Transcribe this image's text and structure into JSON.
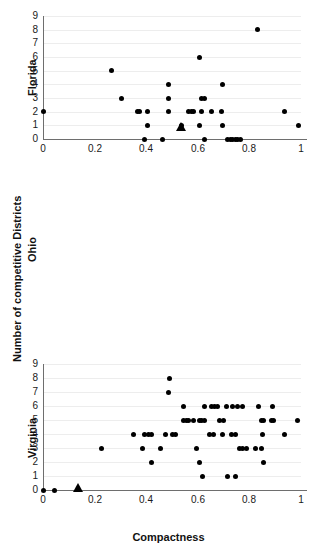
{
  "figure": {
    "xlabel": "Compactness",
    "outer_ylabel": "Number of competitive Districts",
    "background": "#ffffff",
    "point_color": "#000000",
    "grid_color": "#ededed",
    "axis_color": "#6e6e6e"
  },
  "chart_data": [
    {
      "type": "scatter",
      "title": "",
      "panel": "Florida",
      "ylabel": "Florida",
      "xlabel": "",
      "xlim": [
        0,
        1
      ],
      "ylim": [
        0,
        9
      ],
      "xticks": [
        0,
        0.2,
        0.4,
        0.6,
        0.8,
        1
      ],
      "xtick_labels": [
        "0",
        "0.2",
        "0.4",
        "0.6",
        "0.8",
        "1"
      ],
      "yticks": [
        0,
        1,
        2,
        3,
        4,
        5,
        6,
        7,
        8,
        9
      ],
      "ytick_labels": [
        "0",
        "1",
        "2",
        "3",
        "4",
        "5",
        "6",
        "7",
        "8",
        "9"
      ],
      "grid": true,
      "series": [
        {
          "name": "districts",
          "marker": "circle",
          "points": [
            [
              0.0,
              2
            ],
            [
              0.265,
              5
            ],
            [
              0.305,
              3
            ],
            [
              0.365,
              2
            ],
            [
              0.375,
              2
            ],
            [
              0.405,
              2
            ],
            [
              0.405,
              1
            ],
            [
              0.395,
              0
            ],
            [
              0.465,
              0
            ],
            [
              0.485,
              4
            ],
            [
              0.485,
              3
            ],
            [
              0.485,
              2
            ],
            [
              0.535,
              1
            ],
            [
              0.565,
              2
            ],
            [
              0.575,
              2
            ],
            [
              0.585,
              2
            ],
            [
              0.605,
              6
            ],
            [
              0.615,
              3
            ],
            [
              0.625,
              3
            ],
            [
              0.615,
              2
            ],
            [
              0.605,
              1
            ],
            [
              0.625,
              0
            ],
            [
              0.655,
              2
            ],
            [
              0.69,
              2
            ],
            [
              0.695,
              4
            ],
            [
              0.695,
              1
            ],
            [
              0.715,
              0
            ],
            [
              0.725,
              0
            ],
            [
              0.735,
              0
            ],
            [
              0.745,
              0
            ],
            [
              0.755,
              0
            ],
            [
              0.765,
              0
            ],
            [
              0.83,
              8
            ],
            [
              0.935,
              2
            ],
            [
              0.99,
              1
            ]
          ]
        },
        {
          "name": "mean-marker",
          "marker": "triangle",
          "points": [
            [
              0.535,
              0.85
            ]
          ]
        }
      ]
    },
    {
      "type": "scatter",
      "title": "",
      "panel": "Ohio",
      "ylabel": "Ohio",
      "xlabel": "",
      "xlim": [
        0,
        1
      ],
      "ylim": [
        0,
        9
      ],
      "xticks": [
        0,
        0.2,
        0.4,
        0.6,
        0.8,
        1
      ],
      "xtick_labels": [
        "0",
        "0.2",
        "0.4",
        "0.6",
        "0.8",
        "1"
      ],
      "yticks": [
        0,
        1,
        2,
        3,
        4,
        5,
        6,
        7,
        8,
        9
      ],
      "ytick_labels": [
        "0",
        "1",
        "2",
        "3",
        "4",
        "5",
        "6",
        "7",
        "8",
        "9"
      ],
      "grid": true,
      "series": [
        {
          "name": "districts",
          "marker": "circle",
          "points": [
            [
              0.0,
              0
            ],
            [
              0.045,
              0
            ],
            [
              0.225,
              3
            ],
            [
              0.35,
              4
            ],
            [
              0.395,
              4
            ],
            [
              0.41,
              4
            ],
            [
              0.42,
              4
            ],
            [
              0.385,
              3
            ],
            [
              0.42,
              2
            ],
            [
              0.455,
              3
            ],
            [
              0.49,
              8
            ],
            [
              0.485,
              7
            ],
            [
              0.475,
              4
            ],
            [
              0.5,
              4
            ],
            [
              0.515,
              4
            ],
            [
              0.545,
              5
            ],
            [
              0.555,
              5
            ],
            [
              0.565,
              5
            ],
            [
              0.545,
              6
            ],
            [
              0.585,
              5
            ],
            [
              0.605,
              5
            ],
            [
              0.615,
              5
            ],
            [
              0.625,
              5
            ],
            [
              0.595,
              3
            ],
            [
              0.605,
              2
            ],
            [
              0.62,
              1
            ],
            [
              0.625,
              6
            ],
            [
              0.655,
              6
            ],
            [
              0.665,
              6
            ],
            [
              0.675,
              6
            ],
            [
              0.645,
              4
            ],
            [
              0.66,
              4
            ],
            [
              0.685,
              5
            ],
            [
              0.7,
              5
            ],
            [
              0.695,
              4
            ],
            [
              0.71,
              6
            ],
            [
              0.735,
              6
            ],
            [
              0.73,
              4
            ],
            [
              0.745,
              4
            ],
            [
              0.715,
              1
            ],
            [
              0.745,
              1
            ],
            [
              0.755,
              6
            ],
            [
              0.775,
              6
            ],
            [
              0.76,
              3
            ],
            [
              0.775,
              3
            ],
            [
              0.79,
              3
            ],
            [
              0.835,
              6
            ],
            [
              0.845,
              5
            ],
            [
              0.855,
              5
            ],
            [
              0.85,
              4
            ],
            [
              0.855,
              2
            ],
            [
              0.825,
              3
            ],
            [
              0.845,
              3
            ],
            [
              0.885,
              5
            ],
            [
              0.895,
              5
            ],
            [
              0.89,
              6
            ],
            [
              0.935,
              4
            ],
            [
              0.985,
              5
            ]
          ]
        },
        {
          "name": "mean-marker",
          "marker": "triangle",
          "points": [
            [
              0.135,
              0.12
            ]
          ]
        }
      ]
    },
    {
      "type": "scatter",
      "title": "",
      "panel": "Virginia",
      "ylabel": "Virginia",
      "xlabel": "Compactness",
      "xlim": [
        0,
        1
      ],
      "ylim": [
        0,
        4
      ],
      "xticks": [
        0,
        0.2,
        0.4,
        0.6,
        0.8,
        1
      ],
      "xtick_labels": [
        "0",
        "0.2",
        "0.4",
        "0.6",
        "0.8",
        "1"
      ],
      "yticks": [
        0,
        1,
        2,
        3,
        4
      ],
      "ytick_labels": [
        "0",
        "1",
        "2",
        "3",
        "4"
      ],
      "grid": true,
      "series": [
        {
          "name": "districts",
          "marker": "circle",
          "points": [
            [
              0.0,
              1
            ],
            [
              0.12,
              1
            ],
            [
              0.285,
              1
            ],
            [
              0.315,
              2
            ],
            [
              0.335,
              1
            ],
            [
              0.415,
              1
            ],
            [
              0.545,
              2
            ],
            [
              0.575,
              2
            ],
            [
              0.645,
              2
            ],
            [
              0.73,
              1
            ],
            [
              0.83,
              2
            ],
            [
              0.895,
              1
            ],
            [
              0.775,
              0
            ],
            [
              0.815,
              0
            ],
            [
              0.83,
              0
            ],
            [
              0.995,
              0
            ],
            [
              0.99,
              2.9
            ]
          ]
        },
        {
          "name": "mean-marker",
          "marker": "triangle",
          "points": [
            [
              0.05,
              2
            ]
          ]
        }
      ]
    }
  ]
}
